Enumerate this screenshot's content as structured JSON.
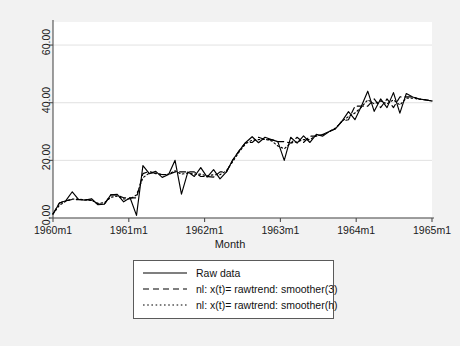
{
  "chart_data": {
    "type": "line",
    "title": "",
    "xlabel": "Month",
    "ylabel": "",
    "xlim": [
      0,
      60
    ],
    "ylim": [
      0,
      68
    ],
    "grid": true,
    "legend_position": "below-axes",
    "x_tick_labels": [
      "1960m1",
      "1961m1",
      "1962m1",
      "1963m1",
      "1964m1",
      "1965m1"
    ],
    "x_tick_values": [
      0,
      12,
      24,
      36,
      48,
      60
    ],
    "y_tick_labels": [
      "0.00",
      "20.00",
      "40.00",
      "60.00"
    ],
    "y_tick_values": [
      0,
      20,
      40,
      60
    ],
    "x_label_format": "YYYYmM",
    "x_start": "1960m1",
    "x_end": "1965m1",
    "n_points": 60,
    "series": [
      {
        "name": "Raw data",
        "style": "solid",
        "color": "#000000",
        "values": [
          1.4,
          5.2,
          6.0,
          9.1,
          6.4,
          6.2,
          6.7,
          4.6,
          4.8,
          8.0,
          8.2,
          5.6,
          7.0,
          0.9,
          18.2,
          15.4,
          16.2,
          14.1,
          15.1,
          20.0,
          8.3,
          16.0,
          14.4,
          17.5,
          14.2,
          16.8,
          13.6,
          16.0,
          20.2,
          23.4,
          26.2,
          28.2,
          26.1,
          28.0,
          27.2,
          26.5,
          20.0,
          28.0,
          26.0,
          28.5,
          26.2,
          29.0,
          28.4,
          30.0,
          31.0,
          33.6,
          36.9,
          34.1,
          38.8,
          44.0,
          37.0,
          41.3,
          38.3,
          43.5,
          36.4,
          43.2,
          42.0,
          41.3,
          41.0,
          40.6
        ]
      },
      {
        "name": "nl: x(t)= rawtrend: smoother(3)",
        "style": "dashed",
        "color": "#000000",
        "values": [
          1.4,
          5.2,
          6.0,
          6.4,
          6.4,
          6.4,
          6.2,
          4.8,
          4.8,
          8.0,
          8.0,
          7.0,
          7.0,
          7.0,
          15.4,
          16.2,
          15.4,
          15.1,
          15.1,
          16.0,
          16.0,
          16.0,
          16.0,
          14.4,
          14.4,
          14.2,
          16.0,
          16.0,
          20.2,
          23.4,
          26.2,
          26.2,
          28.0,
          27.2,
          27.2,
          26.5,
          26.5,
          26.0,
          28.0,
          26.2,
          28.4,
          28.4,
          29.0,
          30.0,
          31.0,
          33.6,
          34.1,
          38.8,
          38.8,
          38.8,
          41.3,
          38.3,
          41.3,
          38.3,
          42.0,
          42.0,
          42.0,
          41.3,
          41.0,
          40.6
        ]
      },
      {
        "name": "nl: x(t)= rawtrend: smoother(h)",
        "style": "dotted",
        "color": "#000000",
        "values": [
          1.4,
          4.4,
          5.8,
          6.6,
          6.5,
          6.3,
          6.1,
          5.1,
          5.3,
          7.2,
          7.6,
          6.6,
          6.6,
          8.0,
          14.0,
          15.6,
          15.6,
          15.0,
          15.2,
          16.4,
          15.2,
          15.6,
          15.2,
          15.2,
          14.6,
          15.0,
          15.0,
          16.4,
          19.6,
          23.0,
          25.8,
          27.0,
          27.2,
          27.3,
          26.8,
          25.0,
          24.0,
          26.0,
          26.4,
          27.2,
          27.2,
          28.6,
          28.8,
          30.0,
          31.2,
          33.6,
          35.2,
          36.4,
          38.4,
          41.0,
          39.6,
          40.6,
          39.6,
          41.0,
          39.2,
          41.6,
          41.6,
          41.2,
          41.0,
          40.6
        ]
      }
    ],
    "annotations": {
      "note": "sharp trough near 1963m11 in raw series"
    }
  },
  "axes": {
    "x_title": "Month",
    "y_title": ""
  },
  "legend": {
    "entries": [
      {
        "label": "Raw data",
        "key": "solid-line-key"
      },
      {
        "label": "nl: x(t)= rawtrend: smoother(3)",
        "key": "dashed-line-key"
      },
      {
        "label": "nl: x(t)= rawtrend: smoother(h)",
        "key": "dotted-line-key"
      }
    ]
  },
  "colors": {
    "background": "#f2f2f2",
    "plot_background": "#ffffff",
    "line": "#000000",
    "grid": "#d9d9d9",
    "axis": "#4d4d4d",
    "legend_border": "#5a5a5a"
  }
}
